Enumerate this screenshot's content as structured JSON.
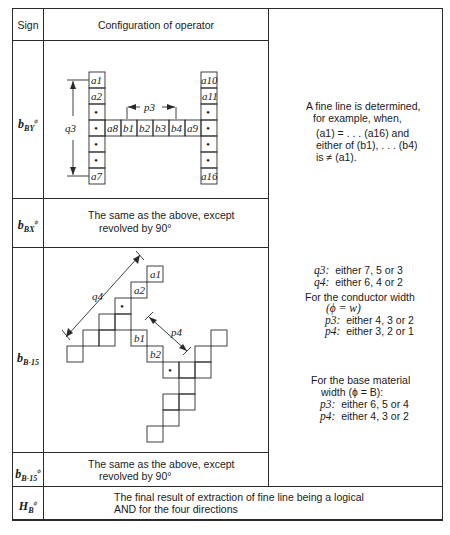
{
  "table": {
    "headers": {
      "sign": "Sign",
      "configuration": "Configuration of operator"
    },
    "rows": [
      {
        "sign": {
          "base": "b",
          "sub": "BY",
          "sup": "ϕ"
        },
        "config_labels": {
          "left_column": [
            "a1",
            "a2",
            "•",
            "•",
            "•",
            "•",
            "a7"
          ],
          "right_column": [
            "a10",
            "a11",
            "•",
            "•",
            "•",
            "•",
            "a16"
          ],
          "middle_row": [
            "a8",
            "b1",
            "b2",
            "b3",
            "b4",
            "a9"
          ],
          "dim_vertical": "q3",
          "dim_horizontal": "p3"
        },
        "description": [
          "A fine line is determined,",
          "for example, when,",
          "(a1) = . . . (a16) and",
          "either of (b1), . . . (b4)",
          "is ≠ (a1)."
        ]
      },
      {
        "sign": {
          "base": "b",
          "sub": "BX",
          "sup": "ϕ"
        },
        "config_text": [
          "The same as the above, except",
          "revolved by 90°"
        ]
      },
      {
        "sign": {
          "base": "b",
          "sub": "B-15",
          "sup": ""
        },
        "config_labels": {
          "cells": [
            "a1",
            "a2",
            "•",
            "b1",
            "b2",
            "•"
          ],
          "dim_long": "q4",
          "dim_short": "p4"
        },
        "description": {
          "q_values": [
            {
              "label": "q3:",
              "text": "either 7, 5 or 3"
            },
            {
              "label": "q4:",
              "text": "either 6, 4 or 2"
            }
          ],
          "conductor": {
            "title": "For the conductor width",
            "cond": "(ϕ = w)",
            "items": [
              {
                "label": "p3:",
                "text": "either 4, 3 or 2"
              },
              {
                "label": "p4:",
                "text": "either 3, 2 or 1"
              }
            ]
          },
          "base": {
            "title": "For the base material",
            "cond": "width (ϕ = B):",
            "items": [
              {
                "label": "p3:",
                "text": "either 6, 5 or 4"
              },
              {
                "label": "p4:",
                "text": "either 4, 3 or 2"
              }
            ]
          }
        }
      },
      {
        "sign": {
          "base": "b",
          "sub": "B-15",
          "sup": "ϕ"
        },
        "config_text": [
          "The same as the above, except",
          "revolved by 90°"
        ]
      },
      {
        "sign": {
          "base": "H",
          "sub": "B",
          "sup": "ϕ"
        },
        "text": [
          "The final result of extraction of fine line being a logical",
          "AND for the four directions"
        ]
      }
    ]
  }
}
